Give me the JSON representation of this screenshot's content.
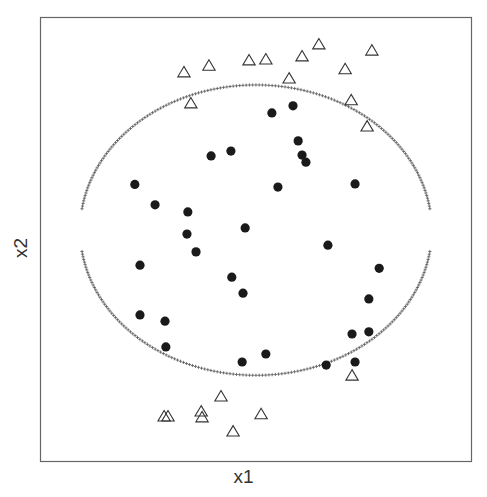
{
  "chart_data": {
    "type": "scatter",
    "title": "",
    "xlabel": "x1",
    "ylabel": "x2",
    "xlim": [
      0,
      1
    ],
    "ylim": [
      0,
      1
    ],
    "grid": false,
    "legend": null,
    "axes_ticks_shown": false,
    "series": [
      {
        "name": "class-inside",
        "marker": "filled-circle",
        "color": "#1a1a1a",
        "points": [
          [
            0.22,
            0.623
          ],
          [
            0.267,
            0.577
          ],
          [
            0.343,
            0.561
          ],
          [
            0.341,
            0.511
          ],
          [
            0.362,
            0.471
          ],
          [
            0.397,
            0.687
          ],
          [
            0.443,
            0.698
          ],
          [
            0.476,
            0.525
          ],
          [
            0.538,
            0.784
          ],
          [
            0.587,
            0.8
          ],
          [
            0.599,
            0.721
          ],
          [
            0.608,
            0.689
          ],
          [
            0.617,
            0.673
          ],
          [
            0.552,
            0.617
          ],
          [
            0.731,
            0.624
          ],
          [
            0.668,
            0.486
          ],
          [
            0.232,
            0.441
          ],
          [
            0.445,
            0.414
          ],
          [
            0.471,
            0.378
          ],
          [
            0.232,
            0.329
          ],
          [
            0.29,
            0.315
          ],
          [
            0.292,
            0.257
          ],
          [
            0.469,
            0.223
          ],
          [
            0.524,
            0.241
          ],
          [
            0.787,
            0.434
          ],
          [
            0.763,
            0.365
          ],
          [
            0.724,
            0.286
          ],
          [
            0.763,
            0.291
          ],
          [
            0.664,
            0.216
          ],
          [
            0.731,
            0.223
          ]
        ]
      },
      {
        "name": "class-outside",
        "marker": "open-triangle",
        "color": "#333333",
        "points": [
          [
            0.334,
            0.874
          ],
          [
            0.392,
            0.889
          ],
          [
            0.485,
            0.901
          ],
          [
            0.524,
            0.903
          ],
          [
            0.608,
            0.91
          ],
          [
            0.647,
            0.937
          ],
          [
            0.77,
            0.923
          ],
          [
            0.578,
            0.86
          ],
          [
            0.708,
            0.881
          ],
          [
            0.35,
            0.804
          ],
          [
            0.722,
            0.811
          ],
          [
            0.759,
            0.752
          ],
          [
            0.288,
            0.099
          ],
          [
            0.297,
            0.099
          ],
          [
            0.374,
            0.11
          ],
          [
            0.376,
            0.097
          ],
          [
            0.42,
            0.144
          ],
          [
            0.448,
            0.065
          ],
          [
            0.513,
            0.104
          ],
          [
            0.724,
            0.191
          ]
        ]
      }
    ],
    "boundary": {
      "name": "decision-boundary",
      "marker": "small-plus",
      "color": "#555555",
      "shape": "ellipse",
      "center": [
        0.501,
        0.52
      ],
      "radii": [
        0.408,
        0.327
      ],
      "gap_half_height": 0.046
    }
  }
}
